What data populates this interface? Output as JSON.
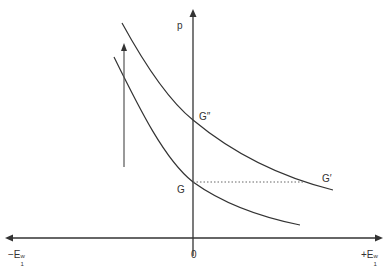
{
  "diagram": {
    "axes": {
      "vertical_label": "p",
      "origin_label": "0",
      "left_label": "−E",
      "left_sup": "w",
      "left_sub": "1",
      "right_label": "+E",
      "right_sup": "w",
      "right_sub": "1"
    },
    "points": {
      "g": "G",
      "g_double_prime": "G″",
      "g_prime": "G′"
    },
    "colors": {
      "line": "#333333",
      "arrow": "#555555",
      "dotted": "#666666"
    }
  }
}
